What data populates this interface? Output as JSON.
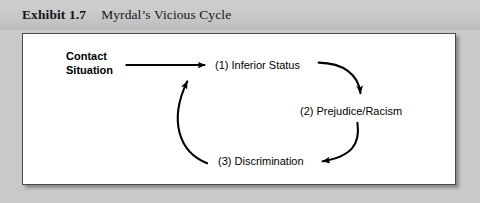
{
  "header": {
    "exhibit_label": "Exhibit 1.7",
    "title": "Myrdal’s Vicious Cycle"
  },
  "figure": {
    "entry_label_line1": "Contact",
    "entry_label_line2": "Situation",
    "nodes": [
      {
        "id": "inferior-status",
        "label": "(1) Inferior Status"
      },
      {
        "id": "prejudice-racism",
        "label": "(2) Prejudice/Racism"
      },
      {
        "id": "discrimination",
        "label": "(3) Discrimination"
      }
    ],
    "arrows": [
      {
        "id": "entry-arrow",
        "from": "contact-situation",
        "to": "inferior-status",
        "style": "straight"
      },
      {
        "id": "arrow-1-to-2",
        "from": "inferior-status",
        "to": "prejudice-racism",
        "style": "curved"
      },
      {
        "id": "arrow-2-to-3",
        "from": "prejudice-racism",
        "to": "discrimination",
        "style": "curved"
      },
      {
        "id": "arrow-3-to-1",
        "from": "discrimination",
        "to": "inferior-status",
        "style": "curved"
      }
    ]
  },
  "colors": {
    "page_background": "#c9c9c9",
    "header_background": "#c8c8c8",
    "panel_background": "#ffffff",
    "panel_border": "#4a4a4a",
    "ink": "#000000"
  }
}
